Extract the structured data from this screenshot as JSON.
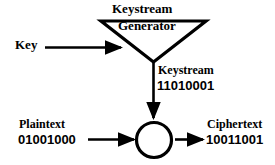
{
  "diagram": {
    "background_color": "#ffffff",
    "line_color": "#000000",
    "nodes": {
      "generator": {
        "shape": "inverted-triangle",
        "heading": "Keystream",
        "body_label": "Generator"
      },
      "xor": {
        "shape": "circle",
        "label": ""
      }
    },
    "labels": {
      "key": "Key",
      "keystream_name": "Keystream",
      "keystream_bits": "11010001",
      "plaintext_name": "Plaintext",
      "plaintext_bits": "01001000",
      "ciphertext_name": "Ciphertext",
      "ciphertext_bits": "10011001"
    },
    "arrows": [
      {
        "name": "key-to-generator",
        "direction": "right"
      },
      {
        "name": "generator-to-xor",
        "direction": "down"
      },
      {
        "name": "plaintext-to-xor",
        "direction": "right"
      },
      {
        "name": "xor-to-ciphertext",
        "direction": "right"
      }
    ]
  }
}
